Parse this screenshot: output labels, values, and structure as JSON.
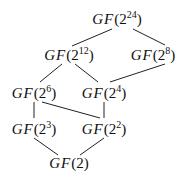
{
  "nodes": [
    {
      "id": "n24",
      "prefix": "GF",
      "base": "2",
      "exp": "24",
      "x": 117,
      "y": 18
    },
    {
      "id": "n12",
      "prefix": "GF",
      "base": "2",
      "exp": "12",
      "x": 69,
      "y": 54
    },
    {
      "id": "n8",
      "prefix": "GF",
      "base": "2",
      "exp": "8",
      "x": 153,
      "y": 54
    },
    {
      "id": "n6",
      "prefix": "GF",
      "base": "2",
      "exp": "6",
      "x": 34,
      "y": 92
    },
    {
      "id": "n4",
      "prefix": "GF",
      "base": "2",
      "exp": "4",
      "x": 104,
      "y": 92
    },
    {
      "id": "n3",
      "prefix": "GF",
      "base": "2",
      "exp": "3",
      "x": 34,
      "y": 128
    },
    {
      "id": "n2",
      "prefix": "GF",
      "base": "2",
      "exp": "2",
      "x": 104,
      "y": 128
    },
    {
      "id": "n1",
      "prefix": "GF",
      "base": "2",
      "exp": "",
      "x": 69,
      "y": 163
    }
  ],
  "edges": [
    [
      112,
      29,
      72,
      46
    ],
    [
      133,
      29,
      165,
      45
    ],
    [
      62,
      64,
      40,
      82
    ],
    [
      75,
      64,
      98,
      82
    ],
    [
      165,
      64,
      110,
      82
    ],
    [
      34,
      102,
      34,
      118
    ],
    [
      42,
      102,
      100,
      118
    ],
    [
      104,
      102,
      104,
      118
    ],
    [
      34,
      138,
      58,
      155
    ],
    [
      104,
      138,
      80,
      155
    ]
  ]
}
